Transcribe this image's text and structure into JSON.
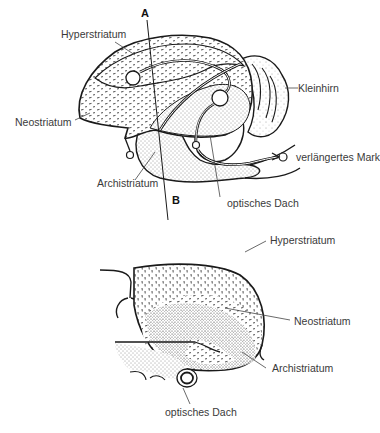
{
  "figure": {
    "upper_diagram": {
      "view": "lateral section",
      "labels": {
        "marker_a": "A",
        "marker_b": "B",
        "hyperstriatum": "Hyperstriatum",
        "neostriatum": "Neostriatum",
        "kleinhirn": "Kleinhirn",
        "verlaengertes_mark": "verlängertes Mark",
        "archistriatum": "Archistriatum",
        "optisches_dach": "optisches Dach"
      }
    },
    "lower_diagram": {
      "view": "cross section",
      "labels": {
        "hyperstriatum": "Hyperstriatum",
        "neostriatum": "Neostriatum",
        "archistriatum": "Archistriatum",
        "optisches_dach": "optisches Dach"
      }
    },
    "colors": {
      "line": "#1a1a1a",
      "label_text": "#3a3a3a",
      "background": "#ffffff"
    }
  }
}
